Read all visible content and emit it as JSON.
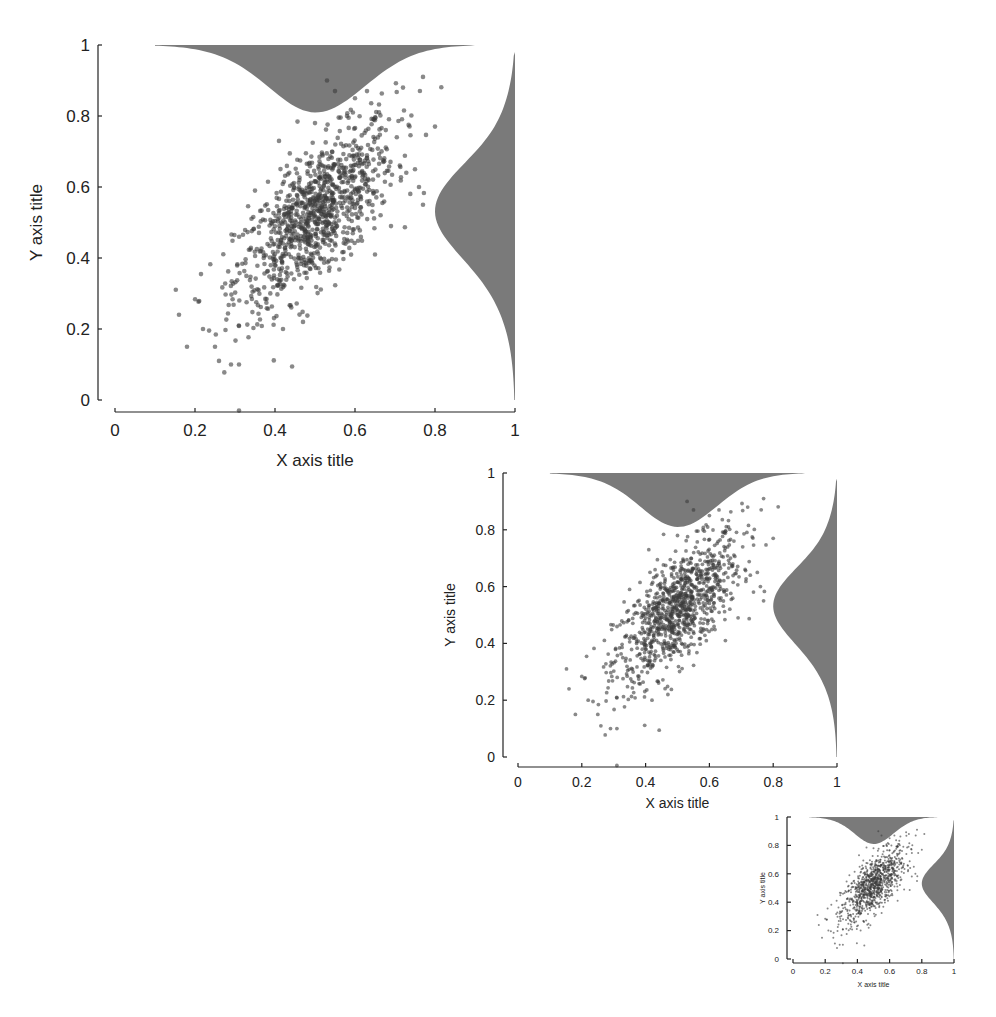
{
  "chart_data": [
    {
      "type": "scatter",
      "title": "",
      "xlabel": "X axis title",
      "ylabel": "Y axis title",
      "xlim": [
        0,
        1
      ],
      "ylim": [
        0,
        1
      ],
      "xticks": [
        "0",
        "0.2",
        "0.4",
        "0.6",
        "0.8",
        "1"
      ],
      "yticks": [
        "0",
        "0.2",
        "0.4",
        "0.6",
        "0.8",
        "1"
      ],
      "grid": false,
      "legend": null,
      "n_points": 1000,
      "distribution": {
        "mean_x": 0.5,
        "mean_y": 0.52,
        "sd_x": 0.1,
        "sd_y": 0.13,
        "correlation": 0.7
      },
      "marginal_x": {
        "type": "density",
        "position": "top, hanging from y=1",
        "peak_at": 0.5
      },
      "marginal_y": {
        "type": "density",
        "position": "right, extending left from x=1",
        "peak_at": 0.52
      },
      "sample_points": [
        [
          0.16,
          0.24
        ],
        [
          0.18,
          0.15
        ],
        [
          0.22,
          0.2
        ],
        [
          0.25,
          0.15
        ],
        [
          0.26,
          0.11
        ],
        [
          0.29,
          0.1
        ],
        [
          0.31,
          0.1
        ],
        [
          0.31,
          -0.03
        ],
        [
          0.35,
          0.59
        ],
        [
          0.41,
          0.73
        ],
        [
          0.42,
          0.2
        ],
        [
          0.47,
          0.22
        ],
        [
          0.5,
          0.78
        ],
        [
          0.53,
          0.9
        ],
        [
          0.55,
          0.87
        ],
        [
          0.58,
          0.8
        ],
        [
          0.6,
          0.85
        ],
        [
          0.63,
          0.87
        ],
        [
          0.65,
          0.41
        ],
        [
          0.69,
          0.49
        ],
        [
          0.72,
          0.88
        ],
        [
          0.75,
          0.65
        ],
        [
          0.76,
          0.6
        ],
        [
          0.77,
          0.91
        ],
        [
          0.77,
          0.55
        ],
        [
          0.8,
          0.77
        ],
        [
          0.45,
          0.45
        ],
        [
          0.5,
          0.5
        ],
        [
          0.55,
          0.6
        ],
        [
          0.4,
          0.38
        ]
      ]
    },
    {
      "type": "scatter",
      "xlabel": "X axis title",
      "ylabel": "Y axis title",
      "xlim": [
        0,
        1
      ],
      "ylim": [
        0,
        1
      ],
      "xticks": [
        "0",
        "0.2",
        "0.4",
        "0.6",
        "0.8",
        "1"
      ],
      "yticks": [
        "0",
        "0.2",
        "0.4",
        "0.6",
        "0.8",
        "1"
      ],
      "note": "same data as chart 1, scaled down"
    },
    {
      "type": "scatter",
      "xlabel": "X axis title",
      "ylabel": "Y axis title",
      "xlim": [
        0,
        1
      ],
      "ylim": [
        0,
        1
      ],
      "xticks": [
        "0",
        "0.2",
        "0.4",
        "0.6",
        "0.8",
        "1"
      ],
      "yticks": [
        "0",
        "0.2",
        "0.4",
        "0.6",
        "0.8",
        "1"
      ],
      "note": "same data as chart 1, smallest scale"
    }
  ],
  "style": {
    "point_color": "#3a3a3a",
    "point_opacity": 0.6,
    "marginal_fill": "#7a7a7a",
    "axis_color": "#222222"
  },
  "charts": [
    {
      "x0": 115,
      "x1": 515,
      "y0": 400,
      "y1": 45,
      "yaxis_x": 98,
      "xaxis_y": 412,
      "font": 17,
      "title_font": 17,
      "point_r": 2.3,
      "xlabel_y": 466,
      "ylabel_x": 42
    },
    {
      "x0": 518,
      "x1": 837,
      "y0": 757,
      "y1": 473,
      "yaxis_x": 503,
      "xaxis_y": 767,
      "font": 14,
      "title_font": 14,
      "point_r": 1.9,
      "xlabel_y": 808,
      "ylabel_x": 455
    },
    {
      "x0": 793,
      "x1": 954,
      "y0": 959,
      "y1": 817,
      "yaxis_x": 787,
      "xaxis_y": 963,
      "font": 8,
      "title_font": 7,
      "point_r": 1.0,
      "xlabel_y": 987,
      "ylabel_x": 765
    }
  ]
}
